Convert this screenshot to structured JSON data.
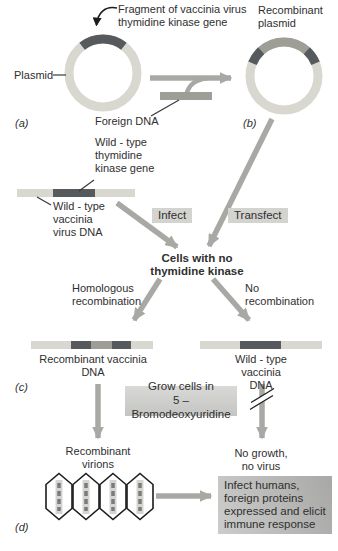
{
  "colors": {
    "ring-light": "#d8d8d0",
    "seg-dark": "#565a5d",
    "seg-medium": "#9e9e97",
    "arrow-gray": "#a8a8a4",
    "box-bg": "#d3d3d0",
    "text": "#2f2f2f",
    "line": "#3a3a3a"
  },
  "panel_a": {
    "fragment_label": "Fragment of vaccinia virus\nthymidine kinase gene",
    "plasmid_label": "Plasmid",
    "foreign_dna_label": "Foreign DNA",
    "panel_letter": "(a)"
  },
  "panel_b": {
    "recombinant_plasmid_label": "Recombinant\nplasmid",
    "panel_letter": "(b)"
  },
  "middle": {
    "wt_tk_gene_label": "Wild - type\nthymidine\nkinase gene",
    "wt_vaccinia_dna_label": "Wild - type\nvaccinia\nvirus DNA",
    "infect_label": "Infect",
    "transfect_label": "Transfect",
    "cells_label": "Cells with no\nthymidine kinase"
  },
  "panel_c": {
    "homologous_label": "Homologous\nrecombination",
    "no_recomb_label": "No\nrecombination",
    "recomb_dna_label": "Recombinant vaccinia\nDNA",
    "wt_dna_label": "Wild - type vaccinia\nDNA",
    "grow_box_label": "Grow cells in\n5 – Bromodeoxyuridine",
    "panel_letter": "(c)"
  },
  "panel_d": {
    "virions_label": "Recombinant\nvirions",
    "no_growth_label": "No growth,\nno virus",
    "infect_humans_label": "Infect humans,\nforeign proteins\nexpressed and elicit\nimmune response",
    "panel_letter": "(d)"
  }
}
